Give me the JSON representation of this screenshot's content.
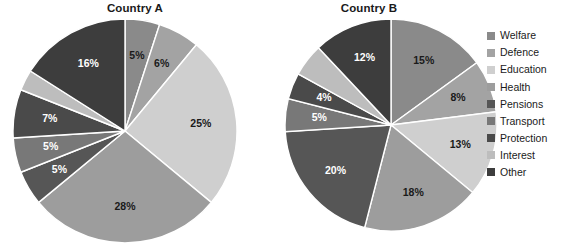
{
  "chart_data": [
    {
      "type": "pie",
      "title": "Country A",
      "categories": [
        "Welfare",
        "Defence",
        "Education",
        "Health",
        "Pensions",
        "Transport",
        "Protection",
        "Interest",
        "Other"
      ],
      "values": [
        5,
        6,
        25,
        28,
        5,
        5,
        7,
        3,
        16
      ],
      "labels": [
        "5%",
        "6%",
        "25%",
        "28%",
        "5%",
        "5%",
        "7%",
        "",
        "16%"
      ],
      "label_visible": [
        true,
        true,
        true,
        true,
        true,
        true,
        true,
        false,
        true
      ],
      "label_color": [
        "dark",
        "dark",
        "dark",
        "dark",
        "light",
        "light",
        "light",
        "light",
        "light"
      ],
      "start_angle_deg": 0,
      "direction": "clockwise",
      "legend_position": "right"
    },
    {
      "type": "pie",
      "title": "Country B",
      "categories": [
        "Welfare",
        "Defence",
        "Education",
        "Health",
        "Pensions",
        "Transport",
        "Protection",
        "Interest",
        "Other"
      ],
      "values": [
        15,
        8,
        13,
        18,
        20,
        5,
        4,
        5,
        12
      ],
      "labels": [
        "15%",
        "8%",
        "13%",
        "18%",
        "20%",
        "5%",
        "4%",
        "",
        "12%"
      ],
      "label_visible": [
        true,
        true,
        true,
        true,
        true,
        true,
        true,
        false,
        true
      ],
      "label_color": [
        "dark",
        "dark",
        "dark",
        "dark",
        "light",
        "light",
        "light",
        "light",
        "light"
      ],
      "start_angle_deg": 0,
      "direction": "clockwise",
      "legend_position": "right"
    }
  ],
  "series_colors": {
    "Welfare": "#8a8a8a",
    "Defence": "#a3a3a3",
    "Education": "#cfcfcf",
    "Health": "#9d9d9d",
    "Pensions": "#565656",
    "Transport": "#787878",
    "Protection": "#4a4a4a",
    "Interest": "#bdbdbd",
    "Other": "#3d3d3d"
  },
  "legend": {
    "items": [
      {
        "label": "Welfare"
      },
      {
        "label": "Defence"
      },
      {
        "label": "Education"
      },
      {
        "label": "Health"
      },
      {
        "label": "Pensions"
      },
      {
        "label": "Transport"
      },
      {
        "label": "Protection"
      },
      {
        "label": "Interest"
      },
      {
        "label": "Other"
      }
    ]
  },
  "background_color": "#ffffff",
  "text_color": "#1a1a1a"
}
